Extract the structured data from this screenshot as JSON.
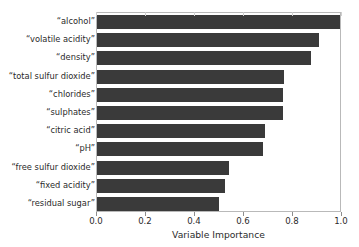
{
  "chart_data": {
    "type": "bar",
    "orientation": "horizontal",
    "title": "",
    "xlabel": "Variable Importance",
    "ylabel": "",
    "xlim": [
      0.0,
      1.0
    ],
    "xticks": [
      "0.0",
      "0.2",
      "0.4",
      "0.6",
      "0.8",
      "1.0"
    ],
    "xtick_values": [
      0.0,
      0.2,
      0.4,
      0.6,
      0.8,
      1.0
    ],
    "grid": false,
    "legend": null,
    "bar_color": "#3a3a3a",
    "categories": [
      "“alcohol”",
      "“volatile acidity”",
      "“density”",
      "“total sulfur dioxide”",
      "“chlorides”",
      "“sulphates”",
      "“citric acid”",
      "“pH”",
      "“free sulfur dioxide”",
      "“fixed acidity”",
      "“residual sugar”"
    ],
    "values": [
      1.0,
      0.915,
      0.88,
      0.77,
      0.765,
      0.765,
      0.69,
      0.685,
      0.545,
      0.525,
      0.5
    ]
  }
}
